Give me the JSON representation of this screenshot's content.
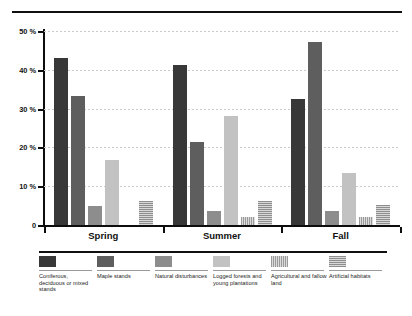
{
  "chart_data": {
    "type": "bar",
    "title": "",
    "xlabel": "",
    "ylabel": "",
    "ylim": [
      0,
      50
    ],
    "yticks": [
      0,
      10,
      20,
      30,
      40,
      50
    ],
    "ytick_labels": [
      "0",
      "10 %",
      "20 %",
      "30 %",
      "40 %",
      "50 %"
    ],
    "grid": true,
    "legend_position": "bottom",
    "categories": [
      "Spring",
      "Summer",
      "Fall"
    ],
    "series": [
      {
        "name": "Coniferous, deciduous or mixed stands",
        "color": "#383838",
        "pattern": "solid",
        "values": [
          43.0,
          41.3,
          32.4
        ]
      },
      {
        "name": "Maple stands",
        "color": "#5e5e5e",
        "pattern": "solid",
        "values": [
          33.2,
          21.5,
          47.2
        ]
      },
      {
        "name": "Natural disturbances",
        "color": "#8d8d8d",
        "pattern": "solid",
        "values": [
          5.0,
          3.6,
          3.6
        ]
      },
      {
        "name": "Logged forests and young plantations",
        "color": "#c2c2c2",
        "pattern": "solid",
        "values": [
          16.8,
          28.0,
          13.3
        ]
      },
      {
        "name": "Agricultural and fallow land",
        "color": "#bdbdbd",
        "pattern": "vertical-stripes",
        "values": [
          0.0,
          2.0,
          2.0
        ]
      },
      {
        "name": "Artificial habitats",
        "color": "#b4b4b4",
        "pattern": "horizontal-stripes",
        "values": [
          6.2,
          6.3,
          5.1
        ]
      }
    ]
  },
  "legend": {
    "items": [
      {
        "label": "Coniferous, deciduous or mixed stands",
        "swatch": "swatch-coniferous"
      },
      {
        "label": "Maple stands",
        "swatch": "swatch-maple"
      },
      {
        "label": "Natural disturbances",
        "swatch": "swatch-natural-disturbances"
      },
      {
        "label": "Logged forests and young plantations",
        "swatch": "swatch-logged-forests"
      },
      {
        "label": "Agricultural and fallow land",
        "swatch": "swatch-agricultural"
      },
      {
        "label": "Artificial habitats",
        "swatch": "swatch-artificial-habitats"
      }
    ]
  }
}
